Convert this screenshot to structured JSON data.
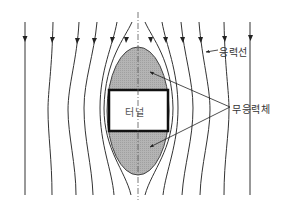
{
  "diagram": {
    "type": "stress-flow-around-tunnel",
    "labels": {
      "stress_lines": "응력선",
      "stress_free_zone": "무응력체",
      "tunnel": "터널"
    },
    "colors": {
      "line": "#333333",
      "shaded_zone": "#b8b8b8",
      "tunnel_border": "#111111",
      "tunnel_fill": "#ffffff"
    },
    "stress_line_count": 12,
    "has_center_axis": true
  }
}
